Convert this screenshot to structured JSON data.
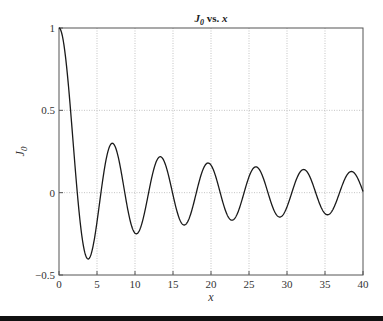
{
  "chart_data": {
    "type": "line",
    "title": "J0 vs. x",
    "title_main": "J",
    "title_sub": "0",
    "title_rest": " vs. x",
    "xlabel": "x",
    "ylabel": "J0",
    "xlim": [
      0,
      40
    ],
    "ylim": [
      -0.5,
      1
    ],
    "xticks": [
      0,
      5,
      10,
      15,
      20,
      25,
      30,
      35,
      40
    ],
    "yticks": [
      -0.5,
      0,
      0.5,
      1
    ],
    "ytick_labels": [
      "−0.5",
      "0",
      "0.5",
      "1"
    ],
    "grid": true,
    "series": [
      {
        "name": "J0(x)",
        "x": [
          0,
          1,
          2,
          3,
          4,
          5,
          6,
          7,
          8,
          9,
          10,
          11,
          12,
          13,
          14,
          15,
          16,
          17,
          18,
          19,
          20,
          21,
          22,
          23,
          24,
          25,
          26,
          27,
          28,
          29,
          30,
          31,
          32,
          33,
          34,
          35,
          36,
          37,
          38,
          39,
          40
        ],
        "values": [
          1,
          0.7652,
          0.2239,
          -0.2601,
          -0.3971,
          -0.1776,
          0.1506,
          0.3001,
          0.1717,
          -0.0903,
          -0.2459,
          -0.1712,
          0.0477,
          0.2069,
          0.1711,
          -0.0142,
          -0.1749,
          -0.1699,
          -0.0134,
          0.1466,
          0.167,
          0.0366,
          -0.1207,
          -0.1624,
          -0.0562,
          0.0963,
          0.156,
          0.0725,
          -0.0732,
          -0.1478,
          -0.0864,
          0.0518,
          0.138,
          0.0978,
          -0.0292,
          -0.1272,
          -0.1066,
          0.0077,
          0.116,
          0.1127,
          0.0074
        ]
      }
    ],
    "colors": {
      "line": "#1a1a1a",
      "grid": "#aaaaaa",
      "axis": "#555555"
    }
  }
}
